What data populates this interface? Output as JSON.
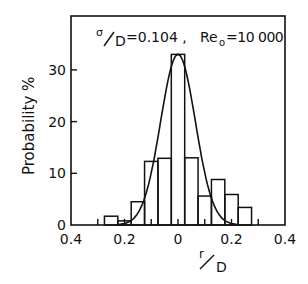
{
  "chart_data": {
    "type": "bar",
    "title": "",
    "annotation": {
      "sigma_label": "σ/D = 0.104",
      "re_label": "Re₀ = 10 000",
      "sigma_num": "σ",
      "sigma_den": "D",
      "sigma_value": "=0.104 ,",
      "re_main": "Re",
      "re_sub": "o",
      "re_value": "=10 000"
    },
    "xlabel": "r/D",
    "xlabel_num": "r",
    "xlabel_den": "D",
    "ylabel": "Probability %",
    "xlim": [
      -0.4,
      0.4
    ],
    "ylim": [
      0,
      37
    ],
    "x_ticks": [
      -0.4,
      -0.2,
      0,
      0.2,
      0.4
    ],
    "x_tick_labels": [
      "0.4",
      "0.2",
      "0",
      "0.2",
      "0.4"
    ],
    "x_minor_ticks": [
      -0.3,
      -0.2,
      -0.1,
      0,
      0.1,
      0.2,
      0.3
    ],
    "y_ticks": [
      0,
      10,
      20,
      30
    ],
    "y_tick_labels": [
      "0",
      "10",
      "20",
      "30"
    ],
    "grid": false,
    "bin_width": 0.05,
    "categories": [
      -0.25,
      -0.2,
      -0.15,
      -0.1,
      -0.05,
      0,
      0.05,
      0.1,
      0.15,
      0.2,
      0.25
    ],
    "values": [
      1.7,
      0.8,
      4.5,
      12.3,
      12.9,
      33.0,
      13.0,
      5.6,
      8.8,
      5.9,
      3.4
    ],
    "fit_curve": {
      "type": "gaussian",
      "peak": 33.0,
      "mean": 0.0,
      "sigma": 0.065,
      "x_range": [
        -0.22,
        0.22
      ]
    }
  }
}
